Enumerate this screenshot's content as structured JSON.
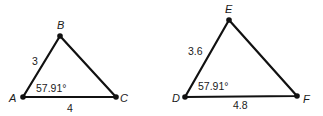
{
  "diagram": {
    "type": "similar-triangles",
    "triangles": [
      {
        "name": "ABC",
        "vertices": [
          {
            "label": "A",
            "x": 23,
            "y": 97
          },
          {
            "label": "B",
            "x": 60,
            "y": 36
          },
          {
            "label": "C",
            "x": 116,
            "y": 97
          }
        ],
        "sides": [
          {
            "between": "AB",
            "label": "3"
          },
          {
            "between": "AC",
            "label": "4"
          }
        ],
        "angle": {
          "at": "A",
          "label": "57.91°"
        }
      },
      {
        "name": "DEF",
        "vertices": [
          {
            "label": "D",
            "x": 185,
            "y": 97
          },
          {
            "label": "E",
            "x": 229,
            "y": 20
          },
          {
            "label": "F",
            "x": 297,
            "y": 96
          }
        ],
        "sides": [
          {
            "between": "DE",
            "label": "3.6"
          },
          {
            "between": "DF",
            "label": "4.8"
          }
        ],
        "angle": {
          "at": "D",
          "label": "57.91°"
        }
      }
    ]
  }
}
